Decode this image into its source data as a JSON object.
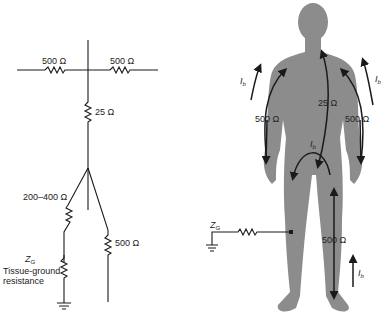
{
  "circuit": {
    "left_arm_resistance": "500 Ω",
    "right_arm_resistance": "500 Ω",
    "torso_resistance": "25 Ω",
    "left_leg_resistance": "200–400 Ω",
    "right_leg_resistance": "500 Ω",
    "ground_impedance_symbol": "Z",
    "ground_impedance_subscript": "G",
    "ground_label_line1": "Tissue-ground",
    "ground_label_line2": "resistance"
  },
  "body_figure": {
    "left_arm_resistance": "500 Ω",
    "right_arm_resistance": "500 Ω",
    "torso_resistance": "25 Ω",
    "leg_resistance": "500 Ω",
    "current_symbol": "I",
    "current_subscript": "b",
    "ground_impedance_symbol": "Z",
    "ground_impedance_subscript": "G",
    "body_color": "#8c8c8c",
    "line_color": "#1a1a1a"
  }
}
